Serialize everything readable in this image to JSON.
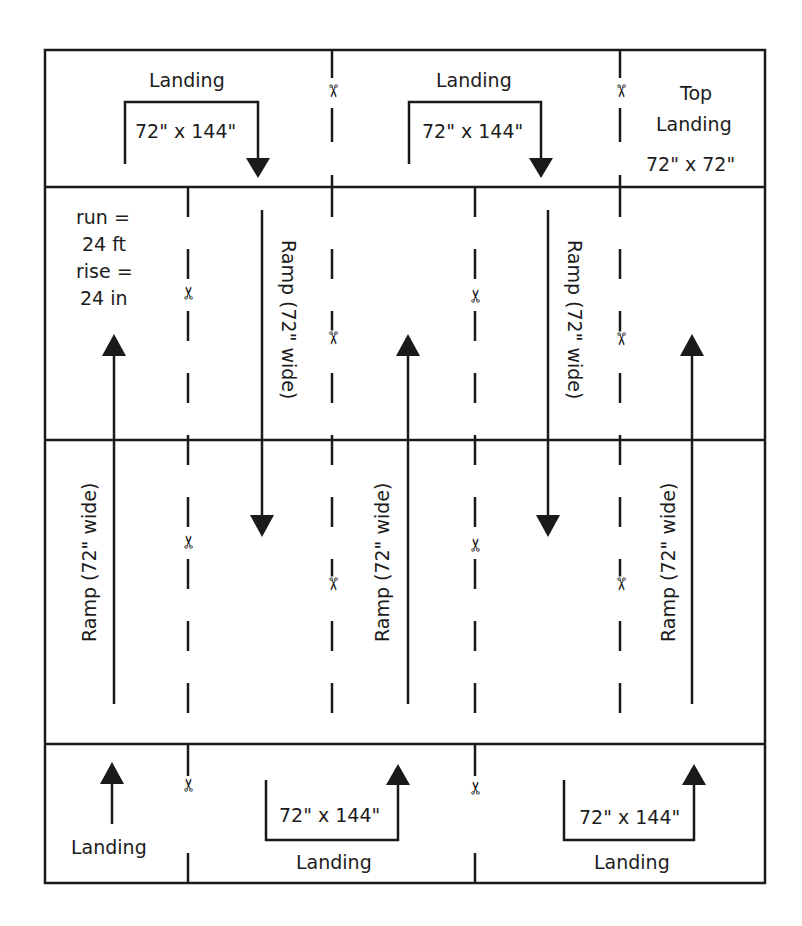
{
  "diagram": {
    "colors": {
      "line": "#1a1a1a",
      "background": "#ffffff"
    },
    "specs": {
      "run_label": "run =",
      "run_value": "24 ft",
      "rise_label": "rise =",
      "rise_value": "24 in"
    },
    "top_row": {
      "landing_1": {
        "title": "Landing",
        "size": "72\" x 144\""
      },
      "landing_2": {
        "title": "Landing",
        "size": "72\" x 144\""
      },
      "top_landing": {
        "title_line1": "Top",
        "title_line2": "Landing",
        "size": "72\" x 72\""
      }
    },
    "ramps": [
      {
        "label": "Ramp (72\" wide)",
        "direction": "up"
      },
      {
        "label": "Ramp (72\" wide)",
        "direction": "down"
      },
      {
        "label": "Ramp (72\" wide)",
        "direction": "up"
      },
      {
        "label": "Ramp (72\" wide)",
        "direction": "down"
      },
      {
        "label": "Ramp (72\" wide)",
        "direction": "up"
      }
    ],
    "bottom_row": {
      "landing_1": {
        "title": "Landing"
      },
      "landing_2": {
        "title": "Landing",
        "size": "72\" x 144\""
      },
      "landing_3": {
        "title": "Landing",
        "size": "72\" x 144\""
      }
    },
    "cut_marks": {
      "icon": "scissors-icon",
      "glyph": "✂",
      "count": 12
    }
  }
}
